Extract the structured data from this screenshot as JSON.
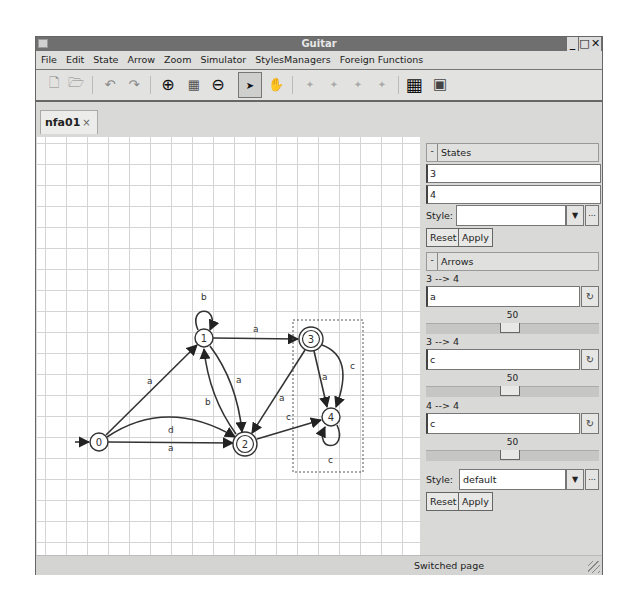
{
  "window": {
    "title": "Guitar",
    "controls": {
      "minimize": "_",
      "maximize": "□",
      "close": "✕"
    }
  },
  "menubar": {
    "items": [
      "File",
      "Edit",
      "State",
      "Arrow",
      "Zoom",
      "Simulator",
      "StylesManagers",
      "Foreign Functions"
    ]
  },
  "toolbar": {
    "buttons": [
      {
        "icon": "new-file-icon",
        "glyph": "🗋"
      },
      {
        "icon": "open-file-icon",
        "glyph": "🗁"
      },
      {
        "icon": "undo-icon",
        "glyph": "↶"
      },
      {
        "icon": "redo-icon",
        "glyph": "↷"
      },
      {
        "icon": "zoom-in-icon",
        "glyph": "⊕"
      },
      {
        "icon": "zoom-fit-icon",
        "glyph": "▦"
      },
      {
        "icon": "zoom-out-icon",
        "glyph": "⊖"
      },
      {
        "icon": "select-pointer-icon",
        "glyph": "➤"
      },
      {
        "icon": "pan-hand-icon",
        "glyph": "✋"
      },
      {
        "icon": "add-state-icon",
        "glyph": "✦"
      },
      {
        "icon": "add-arrow-icon",
        "glyph": "✦"
      },
      {
        "icon": "initial-state-icon",
        "glyph": "✦"
      },
      {
        "icon": "final-state-icon",
        "glyph": "✦"
      },
      {
        "icon": "grid-icon",
        "glyph": "▦"
      },
      {
        "icon": "export-image-icon",
        "glyph": "▣"
      }
    ]
  },
  "tabs": [
    {
      "label": "nfa01",
      "close": "×"
    }
  ],
  "graph": {
    "states": [
      {
        "id": "0",
        "x": 62,
        "y": 305,
        "initial": true,
        "final": false
      },
      {
        "id": "1",
        "x": 167,
        "y": 201,
        "initial": false,
        "final": false
      },
      {
        "id": "2",
        "x": 208,
        "y": 307,
        "initial": false,
        "final": true
      },
      {
        "id": "3",
        "x": 274,
        "y": 202,
        "initial": false,
        "final": true
      },
      {
        "id": "4",
        "x": 294,
        "y": 280,
        "initial": false,
        "final": false
      }
    ],
    "transitions": [
      {
        "from": "0",
        "to": "1",
        "label": "a"
      },
      {
        "from": "0",
        "to": "2",
        "label": "d"
      },
      {
        "from": "0",
        "to": "2",
        "label": "a"
      },
      {
        "from": "1",
        "to": "1",
        "label": "b"
      },
      {
        "from": "1",
        "to": "3",
        "label": "a"
      },
      {
        "from": "1",
        "to": "2",
        "label": "a"
      },
      {
        "from": "2",
        "to": "1",
        "label": "b"
      },
      {
        "from": "2",
        "to": "4",
        "label": "c"
      },
      {
        "from": "3",
        "to": "2",
        "label": "a"
      },
      {
        "from": "3",
        "to": "4",
        "label": "a"
      },
      {
        "from": "3",
        "to": "4",
        "label": "c"
      },
      {
        "from": "4",
        "to": "4",
        "label": "c"
      }
    ]
  },
  "sidebar": {
    "states": {
      "toggle": "-",
      "header": "States",
      "names": [
        "3",
        "4"
      ],
      "style_label": "Style:",
      "style_value": "",
      "combo_arrow": "▼",
      "more": "...",
      "reset": "Reset",
      "apply": "Apply"
    },
    "arrows": {
      "toggle": "-",
      "header": "Arrows",
      "items": [
        {
          "title": "3 --> 4",
          "label": "a",
          "value": "50"
        },
        {
          "title": "3 --> 4",
          "label": "c",
          "value": "50"
        },
        {
          "title": "4 --> 4",
          "label": "c",
          "value": "50"
        }
      ],
      "refresh_glyph": "↻",
      "style_label": "Style:",
      "style_value": "default",
      "combo_arrow": "▼",
      "more": "...",
      "reset": "Reset",
      "apply": "Apply"
    }
  },
  "statusbar": {
    "message": "Switched page"
  }
}
